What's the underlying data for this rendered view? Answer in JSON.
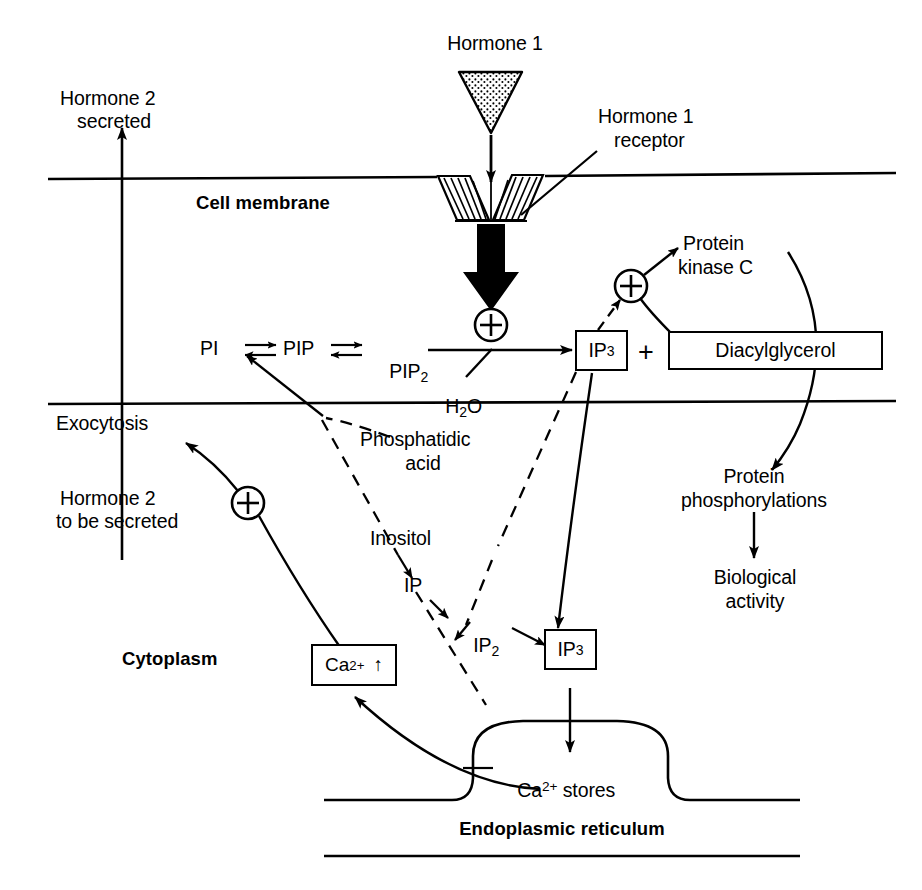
{
  "figure": {
    "domain": "diagram",
    "kind": "biological-signaling-pathway",
    "background_color": "#ffffff",
    "stroke_color": "#000000"
  },
  "labels": {
    "hormone1": "Hormone 1",
    "hormone1_receptor_line1": "Hormone 1",
    "hormone1_receptor_line2": "receptor",
    "hormone2_secreted_line1": "Hormone 2",
    "hormone2_secreted_line2": "secreted",
    "cell_membrane": "Cell membrane",
    "cytoplasm": "Cytoplasm",
    "exocytosis": "Exocytosis",
    "hormone2_tobe_line1": "Hormone 2",
    "hormone2_tobe_line2": "to be secreted",
    "pi": "PI",
    "pip": "PIP",
    "pip2_base": "PIP",
    "pip2_sub": "2",
    "water_base": "H",
    "water_sub": "2",
    "water_tail": "O",
    "ip3_membrane_base": "IP",
    "ip3_membrane_sub": "3",
    "plus_operator": "+",
    "diacylglycerol": "Diacylglycerol",
    "protein_kinase_c_line1": "Protein",
    "protein_kinase_c_line2": "kinase C",
    "protein_phosph_line1": "Protein",
    "protein_phosph_line2": "phosphorylations",
    "biological_activity_line1": "Biological",
    "biological_activity_line2": "activity",
    "phosphatidic_acid_line1": "Phosphatidic",
    "phosphatidic_acid_line2": "acid",
    "inositol": "Inositol",
    "ip": "IP",
    "ip2_base": "IP",
    "ip2_sub": "2",
    "ip3_cyto_base": "IP",
    "ip3_cyto_sub": "3",
    "calcium_base": "Ca",
    "calcium_sup": "2+",
    "calcium_arrow": "↑",
    "calcium_stores_base": "Ca",
    "calcium_stores_sup": "2+",
    "calcium_stores_tail": " stores",
    "endoplasmic_reticulum": "Endoplasmic reticulum"
  },
  "pathway_nodes": [
    "Hormone 1",
    "Hormone 1 receptor",
    "PI",
    "PIP",
    "PIP2",
    "H2O",
    "IP3",
    "Diacylglycerol",
    "Protein kinase C",
    "Protein phosphorylations",
    "Biological activity",
    "Phosphatidic acid",
    "Inositol",
    "IP",
    "IP2",
    "Ca2+ stores",
    "Ca2+ increase",
    "Exocytosis",
    "Hormone 2 secreted"
  ],
  "compartments": [
    "Cell membrane",
    "Cytoplasm",
    "Endoplasmic reticulum"
  ]
}
